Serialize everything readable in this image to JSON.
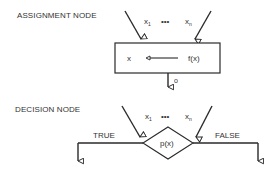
{
  "diagram": {
    "assignment": {
      "title": "ASSIGNMENT NODE",
      "inputs": {
        "first": "x",
        "first_sub": "1",
        "ellipsis": "•••",
        "last": "x",
        "last_sub": "n"
      },
      "target_var": "x",
      "expression": "f(x)",
      "output_label": "o"
    },
    "decision": {
      "title": "DECISION NODE",
      "inputs": {
        "first": "x",
        "first_sub": "1",
        "ellipsis": "•••",
        "last": "x",
        "last_sub": "n"
      },
      "predicate": "p(x)",
      "true_label": "TRUE",
      "false_label": "FALSE"
    },
    "colors": {
      "line": "#2a2a2a",
      "background": "#ffffff"
    }
  }
}
